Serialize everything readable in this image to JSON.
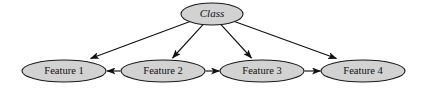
{
  "diagram": {
    "type": "bayesian-network",
    "title": "",
    "background_color": "#ffffff",
    "node_fill_color": "#d2d2d2",
    "node_stroke_color": "#1a1a1a",
    "edge_color": "#111111",
    "nodes": [
      {
        "id": "class",
        "label": "Class",
        "style": "italic",
        "cx": 212,
        "cy": 14,
        "rx": 31,
        "ry": 11
      },
      {
        "id": "feature1",
        "label": "Feature 1",
        "style": "roman",
        "cx": 64,
        "cy": 71,
        "rx": 42,
        "ry": 11
      },
      {
        "id": "feature2",
        "label": "Feature 2",
        "style": "roman",
        "cx": 163,
        "cy": 71,
        "rx": 42,
        "ry": 11
      },
      {
        "id": "feature3",
        "label": "Feature 3",
        "style": "roman",
        "cx": 262,
        "cy": 71,
        "rx": 42,
        "ry": 11
      },
      {
        "id": "feature4",
        "label": "Feature 4",
        "style": "roman",
        "cx": 363,
        "cy": 71,
        "rx": 42,
        "ry": 11
      }
    ],
    "edges": [
      {
        "id": "class-to-feature1",
        "from": "class",
        "to": "feature1",
        "directed": true
      },
      {
        "id": "class-to-feature2",
        "from": "class",
        "to": "feature2",
        "directed": true
      },
      {
        "id": "class-to-feature3",
        "from": "class",
        "to": "feature3",
        "directed": true
      },
      {
        "id": "class-to-feature4",
        "from": "class",
        "to": "feature4",
        "directed": true
      },
      {
        "id": "feature2-to-feature1",
        "from": "feature2",
        "to": "feature1",
        "directed": true
      },
      {
        "id": "feature2-to-feature3",
        "from": "feature2",
        "to": "feature3",
        "directed": true
      },
      {
        "id": "feature3-to-feature4",
        "from": "feature3",
        "to": "feature4",
        "directed": true
      }
    ]
  }
}
